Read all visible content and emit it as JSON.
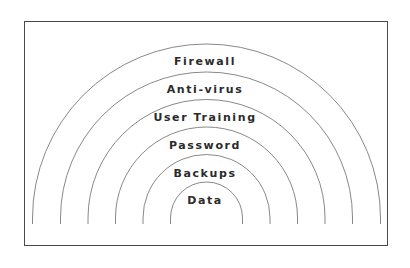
{
  "diagram": {
    "title": "",
    "type": "concentric-layers",
    "colors": {
      "stroke": "#7a7a7a",
      "text": "#2b2b2b",
      "frame": "#4a4a4a"
    },
    "layers": [
      {
        "label": "Firewall",
        "order": 1
      },
      {
        "label": "Anti-virus",
        "order": 2
      },
      {
        "label": "User Training",
        "order": 3
      },
      {
        "label": "Password",
        "order": 4
      },
      {
        "label": "Backups",
        "order": 5
      },
      {
        "label": "Data",
        "order": 6
      }
    ]
  }
}
